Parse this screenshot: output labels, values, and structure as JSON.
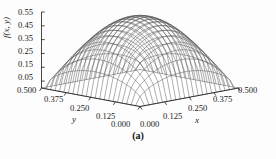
{
  "figure": {
    "caption": "(a)",
    "background_color": "#fdfdfd",
    "mesh_color": "#4a4a4a",
    "axis_color": "#1a1a1a"
  },
  "axes": {
    "z": {
      "title": "f(x, y)",
      "ticks": [
        "0.55",
        "0.45",
        "0.35",
        "0.25",
        "0.15",
        "0.05"
      ]
    },
    "y": {
      "title": "y",
      "ticks": [
        "0.500",
        "0.375",
        "0.250",
        "0.125",
        "0.000"
      ]
    },
    "x": {
      "title": "x",
      "ticks": [
        "0.000",
        "0.125",
        "0.250",
        "0.375",
        "0.500"
      ]
    }
  },
  "chart_data": {
    "type": "surface",
    "title": "",
    "subtitle": "",
    "caption": "(a)",
    "xlabel": "x",
    "ylabel": "y",
    "zlabel": "f(x, y)",
    "xlim": [
      0.0,
      0.5
    ],
    "ylim": [
      0.0,
      0.5
    ],
    "zlim": [
      0.0,
      0.55
    ],
    "xticks": [
      0.0,
      0.125,
      0.25,
      0.375,
      0.5
    ],
    "yticks": [
      0.0,
      0.125,
      0.25,
      0.375,
      0.5
    ],
    "zticks": [
      0.05,
      0.15,
      0.25,
      0.35,
      0.45,
      0.55
    ],
    "grid": false,
    "legend": null,
    "mesh_divisions_x": 22,
    "mesh_divisions_y": 22,
    "peak": {
      "x": 0.25,
      "y": 0.25,
      "z": 0.52
    },
    "surface_formula": "0.52 * (sin(pi*x/0.5) * sin(pi*y/0.5))^0.55",
    "z_sample_grid": {
      "x": [
        0.0,
        0.125,
        0.25,
        0.375,
        0.5
      ],
      "y": [
        0.0,
        0.125,
        0.25,
        0.375,
        0.5
      ],
      "z": [
        [
          0.0,
          0.0,
          0.0,
          0.0,
          0.0
        ],
        [
          0.0,
          0.35,
          0.44,
          0.35,
          0.0
        ],
        [
          0.0,
          0.44,
          0.52,
          0.44,
          0.0
        ],
        [
          0.0,
          0.35,
          0.44,
          0.35,
          0.0
        ],
        [
          0.0,
          0.0,
          0.0,
          0.0,
          0.0
        ]
      ]
    }
  }
}
